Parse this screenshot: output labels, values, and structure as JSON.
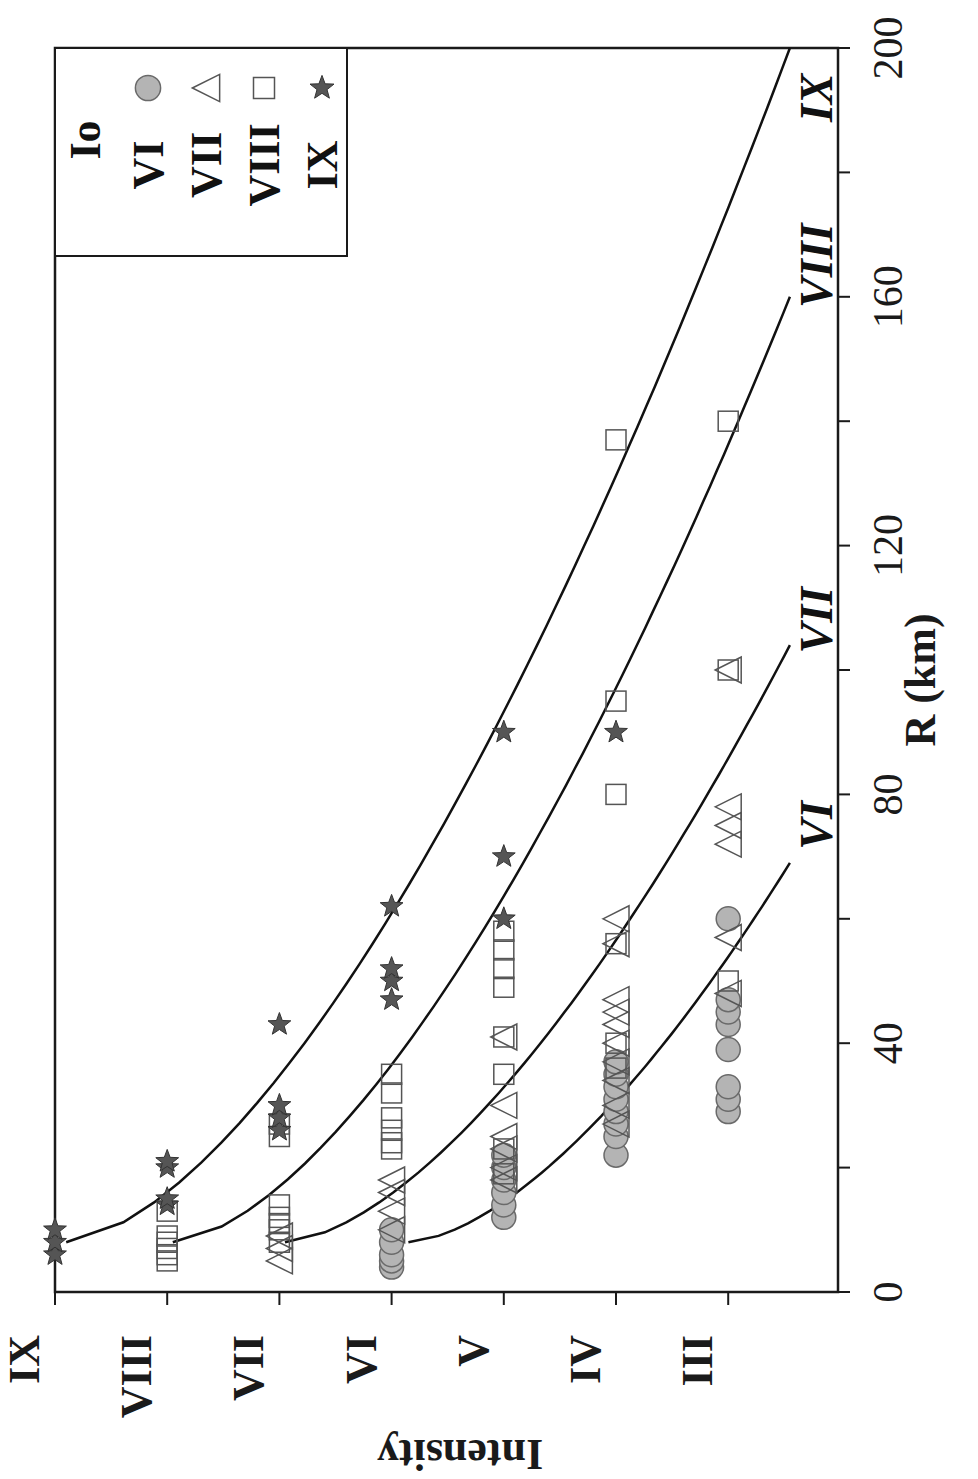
{
  "chart_data": {
    "type": "scatter",
    "orientation_note": "figure rotated 90 degrees clockwise on page",
    "title": "",
    "xlabel": "R (km)",
    "ylabel": "Intensity",
    "xlim": [
      0,
      200
    ],
    "x_ticks": [
      0,
      40,
      80,
      120,
      160,
      200
    ],
    "x_minor_ticks": [
      20,
      60,
      100,
      140,
      180
    ],
    "y_ticks": [
      "III",
      "IV",
      "V",
      "VI",
      "VII",
      "VIII",
      "IX"
    ],
    "y_tick_values": [
      3,
      4,
      5,
      6,
      7,
      8,
      9
    ],
    "grid": false,
    "legend": {
      "title": "Io",
      "position": "upper-right (rotated: top-left)",
      "entries": [
        {
          "label": "VI",
          "marker": "circle",
          "fill": "#b0b0b0"
        },
        {
          "label": "VII",
          "marker": "triangle",
          "fill": "none"
        },
        {
          "label": "VIII",
          "marker": "square",
          "fill": "none"
        },
        {
          "label": "IX",
          "marker": "star",
          "fill": "#555555"
        }
      ]
    },
    "series": [
      {
        "name": "VI",
        "marker": "circle",
        "points": [
          [
            4,
            6
          ],
          [
            5,
            6
          ],
          [
            6,
            6
          ],
          [
            8,
            6
          ],
          [
            10,
            6
          ],
          [
            12,
            5
          ],
          [
            14,
            5
          ],
          [
            16,
            5
          ],
          [
            18,
            5
          ],
          [
            20,
            5
          ],
          [
            22,
            5
          ],
          [
            22,
            4
          ],
          [
            25,
            4
          ],
          [
            27,
            4
          ],
          [
            29,
            4
          ],
          [
            31,
            4
          ],
          [
            33,
            4
          ],
          [
            35,
            4
          ],
          [
            37,
            4
          ],
          [
            29,
            3
          ],
          [
            31,
            3
          ],
          [
            33,
            3
          ],
          [
            39,
            3
          ],
          [
            43,
            3
          ],
          [
            45,
            3
          ],
          [
            47,
            3
          ],
          [
            60,
            3
          ]
        ]
      },
      {
        "name": "VII",
        "marker": "triangle",
        "points": [
          [
            5,
            7
          ],
          [
            7,
            7
          ],
          [
            9,
            7
          ],
          [
            10,
            6
          ],
          [
            13,
            6
          ],
          [
            16,
            6
          ],
          [
            18,
            6
          ],
          [
            18,
            5
          ],
          [
            20,
            5
          ],
          [
            23,
            5
          ],
          [
            25,
            5
          ],
          [
            30,
            5
          ],
          [
            41,
            5
          ],
          [
            27,
            4
          ],
          [
            30,
            4
          ],
          [
            34,
            4
          ],
          [
            37,
            4
          ],
          [
            40,
            4
          ],
          [
            43,
            4
          ],
          [
            45,
            4
          ],
          [
            47,
            4
          ],
          [
            56,
            4
          ],
          [
            60,
            4
          ],
          [
            48,
            3
          ],
          [
            57,
            3
          ],
          [
            72,
            3
          ],
          [
            75,
            3
          ],
          [
            78,
            3
          ],
          [
            100,
            3
          ]
        ]
      },
      {
        "name": "VIII",
        "marker": "square",
        "points": [
          [
            5,
            8
          ],
          [
            6,
            8
          ],
          [
            7,
            8
          ],
          [
            8,
            8
          ],
          [
            9,
            8
          ],
          [
            8,
            7
          ],
          [
            10,
            7
          ],
          [
            11,
            7
          ],
          [
            12,
            7
          ],
          [
            14,
            7
          ],
          [
            25,
            7
          ],
          [
            27,
            7
          ],
          [
            13,
            8
          ],
          [
            23,
            6
          ],
          [
            24,
            6
          ],
          [
            26,
            6
          ],
          [
            28,
            6
          ],
          [
            32,
            6
          ],
          [
            35,
            6
          ],
          [
            19,
            5
          ],
          [
            23,
            5
          ],
          [
            35,
            5
          ],
          [
            41,
            5
          ],
          [
            49,
            5
          ],
          [
            52,
            5
          ],
          [
            55,
            5
          ],
          [
            58,
            5
          ],
          [
            36,
            4
          ],
          [
            40,
            4
          ],
          [
            56,
            4
          ],
          [
            80,
            4
          ],
          [
            95,
            4
          ],
          [
            137,
            4
          ],
          [
            50,
            3
          ],
          [
            100,
            3
          ],
          [
            140,
            3
          ]
        ]
      },
      {
        "name": "IX",
        "marker": "star",
        "points": [
          [
            6,
            9
          ],
          [
            8,
            9
          ],
          [
            10,
            9
          ],
          [
            14,
            8
          ],
          [
            15,
            8
          ],
          [
            20,
            8
          ],
          [
            21,
            8
          ],
          [
            26,
            7
          ],
          [
            28,
            7
          ],
          [
            30,
            7
          ],
          [
            43,
            7
          ],
          [
            47,
            6
          ],
          [
            50,
            6
          ],
          [
            52,
            6
          ],
          [
            62,
            6
          ],
          [
            60,
            5
          ],
          [
            70,
            5
          ],
          [
            90,
            5
          ],
          [
            90,
            4
          ]
        ]
      }
    ],
    "curves": [
      {
        "label": "VI",
        "from_R": 8,
        "to_R": 69,
        "I_start": 5.85,
        "I_end": 2.45,
        "label_R": 75
      },
      {
        "label": "VII",
        "from_R": 8,
        "to_R": 104,
        "I_start": 6.95,
        "I_end": 2.45,
        "label_R": 108
      },
      {
        "label": "VIII",
        "from_R": 8,
        "to_R": 160,
        "I_start": 7.95,
        "I_end": 2.45,
        "label_R": 165
      },
      {
        "label": "IX",
        "from_R": 8,
        "to_R": 200,
        "I_start": 8.9,
        "I_end": 2.45,
        "label_R": 192
      }
    ]
  },
  "legend_title": "Io",
  "legend_labels": [
    "VI",
    "VII",
    "VIII",
    "IX"
  ],
  "axis": {
    "x_title": "R (km)",
    "y_title": "Intensity",
    "x_tick_labels": [
      "0",
      "40",
      "80",
      "120",
      "160",
      "200"
    ],
    "y_tick_labels": [
      "IX",
      "VIII",
      "VII",
      "VI",
      "V",
      "IV",
      "III"
    ]
  },
  "colors": {
    "axis": "#1a1a1a",
    "circle_fill": "#b4b4b4",
    "circle_stroke": "#6a6a6a",
    "star_fill": "#555555",
    "open_stroke": "#555555",
    "curve": "#111111"
  }
}
